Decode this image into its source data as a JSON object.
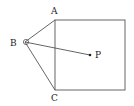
{
  "diagram": {
    "type": "geometry",
    "colors": {
      "stroke": "#555555",
      "label": "#222222",
      "background": "#ffffff"
    },
    "square": {
      "x": 55,
      "y": 20,
      "width": 70,
      "height": 70
    },
    "points": {
      "A": {
        "label": "A",
        "x": 55,
        "y": 20,
        "label_x": 52,
        "label_y": 13
      },
      "B": {
        "label": "B",
        "x": 25,
        "y": 42,
        "label_x": 10,
        "label_y": 46
      },
      "C": {
        "label": "C",
        "x": 55,
        "y": 90,
        "label_x": 52,
        "label_y": 101
      },
      "P": {
        "label": "P",
        "x": 90,
        "y": 55,
        "label_x": 96,
        "label_y": 58
      }
    },
    "segments": [
      {
        "from": "B",
        "to": "A"
      },
      {
        "from": "B",
        "to": "C"
      },
      {
        "from": "B",
        "to": "P"
      }
    ],
    "angle_marker_at": "B"
  }
}
